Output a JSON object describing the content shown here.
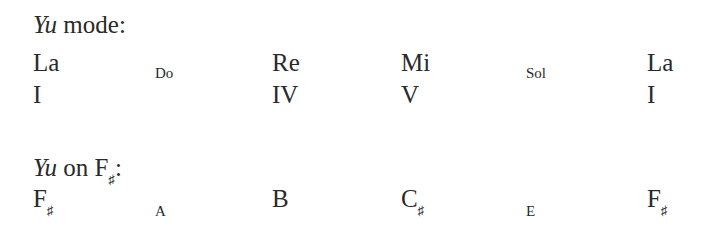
{
  "section1": {
    "title_italic": "Yu",
    "title_rest": " mode:",
    "degrees": [
      {
        "label": "La",
        "size": "large",
        "numeral": "I"
      },
      {
        "label": "Do",
        "size": "small",
        "numeral": ""
      },
      {
        "label": "Re",
        "size": "large",
        "numeral": "IV"
      },
      {
        "label": "Mi",
        "size": "large",
        "numeral": "V"
      },
      {
        "label": "Sol",
        "size": "small",
        "numeral": ""
      },
      {
        "label": "La",
        "size": "large",
        "numeral": "I"
      }
    ]
  },
  "section2": {
    "title_italic": "Yu",
    "title_rest": " on F",
    "title_sharp": "♯",
    "title_colon": ":",
    "notes": [
      {
        "letter": "F",
        "accidental": "♯",
        "size": "large"
      },
      {
        "letter": "A",
        "accidental": "",
        "size": "small"
      },
      {
        "letter": "B",
        "accidental": "",
        "size": "large"
      },
      {
        "letter": "C",
        "accidental": "♯",
        "size": "large"
      },
      {
        "letter": "E",
        "accidental": "",
        "size": "small"
      },
      {
        "letter": "F",
        "accidental": "♯",
        "size": "large"
      }
    ]
  }
}
